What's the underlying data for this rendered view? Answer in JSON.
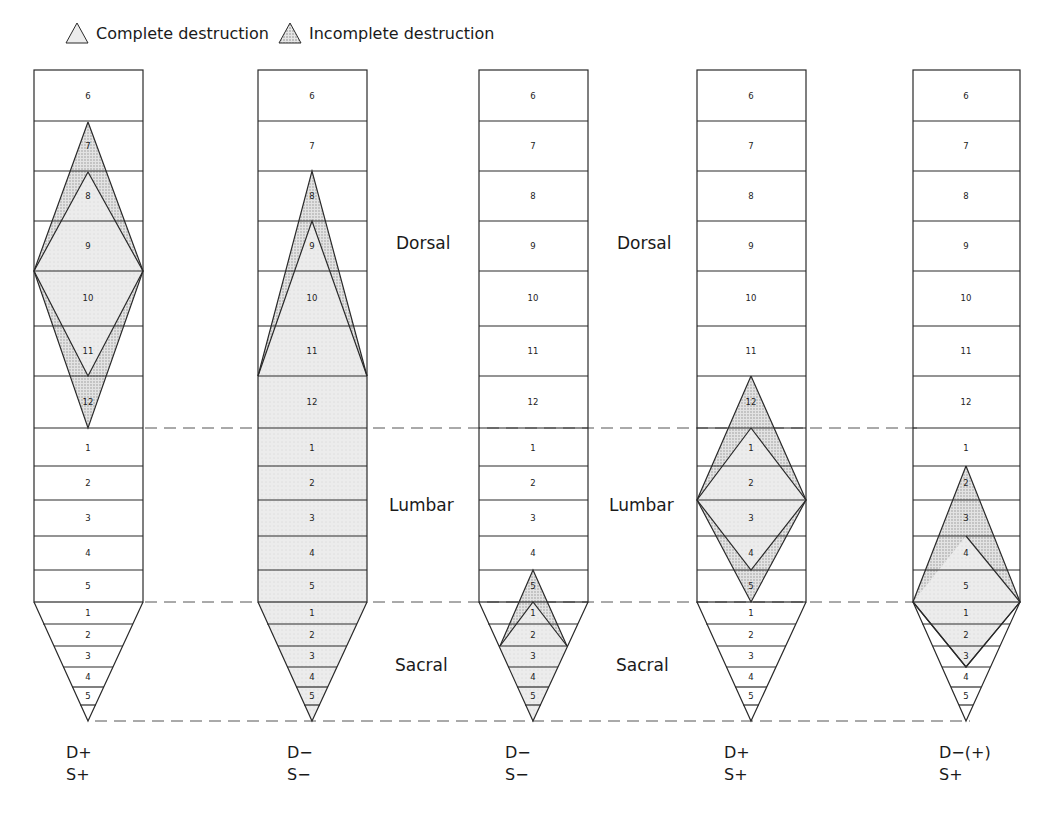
{
  "legend": {
    "complete_label": "Complete destruction",
    "incomplete_label": "Incomplete destruction",
    "complete_icon": "triangle-light-fill-icon",
    "incomplete_icon": "triangle-stipple-fill-icon"
  },
  "regions": {
    "dorsal": "Dorsal",
    "lumbar": "Lumbar",
    "sacral": "Sacral"
  },
  "segments": {
    "dorsal": [
      "6",
      "7",
      "8",
      "9",
      "10",
      "11",
      "12"
    ],
    "lumbar": [
      "1",
      "2",
      "3",
      "4",
      "5"
    ],
    "sacral": [
      "1",
      "2",
      "3",
      "4",
      "5"
    ]
  },
  "columns": [
    {
      "id": "col1",
      "d_code": "D+",
      "s_code": "S+",
      "lesion": "Diamond lesion in dorsal cord (incomplete D7–D12, complete D8–D11)"
    },
    {
      "id": "col2",
      "d_code": "D−",
      "s_code": "S−",
      "lesion": "Complete destruction from D8/D9 down through lumbar and sacral"
    },
    {
      "id": "col3",
      "d_code": "D−",
      "s_code": "S−",
      "lesion": "Small lesion at L5–S2 (incomplete from L5, complete S1–S2)"
    },
    {
      "id": "col4",
      "d_code": "D+",
      "s_code": "S+",
      "lesion": "Diamond lesion D12–L5 (incomplete), L1–L4 (complete)"
    },
    {
      "id": "col5",
      "d_code": "D−(+)",
      "s_code": "S+",
      "lesion": "Diamond lesion L2–S3 (incomplete L2–L4, complete L4–S3)"
    }
  ],
  "colors": {
    "line": "#2a2a2a",
    "complete_fill": "#e4e4e4",
    "incomplete_fill": "#cfcfcf",
    "background": "#ffffff"
  }
}
